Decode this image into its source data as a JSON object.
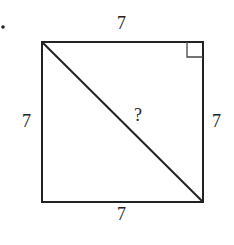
{
  "figure": {
    "bullet": "•",
    "shape": "square",
    "labels": {
      "top": "7",
      "left": "7",
      "right": "7",
      "bottom": "7",
      "diagonal": "?"
    },
    "right_angle_marker": "top-right corner",
    "diagonal": "top-left to bottom-right",
    "colors": {
      "stroke": "#222222",
      "background": "#ffffff"
    }
  }
}
